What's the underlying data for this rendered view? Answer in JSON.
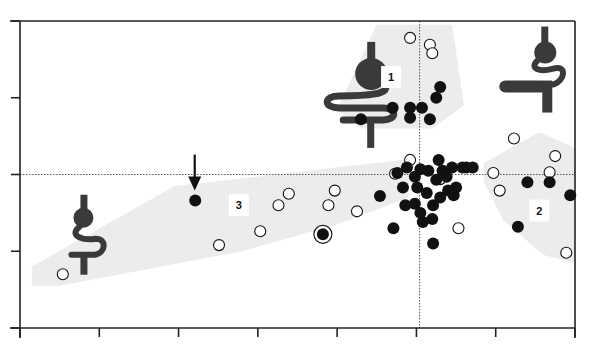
{
  "chart_data": {
    "type": "scatter",
    "title": "",
    "xlabel": "",
    "ylabel": "",
    "xlim": [
      0,
      7
    ],
    "ylim": [
      0,
      4
    ],
    "x_ticks": [
      0,
      1,
      2,
      3,
      4,
      5,
      6,
      7
    ],
    "y_ticks": [
      0,
      1,
      2,
      3,
      4
    ],
    "x_tick_labels": [],
    "y_tick_labels": [],
    "grid": false,
    "reference_lines": {
      "vertical_x": 5.04,
      "horizontal_y": 2.0,
      "style": "dotted"
    },
    "colors": {
      "filled_marker": "#111111",
      "open_marker_fill": "#ffffff",
      "region_fill": "#ececec",
      "axis": "#222222",
      "icon": "#3a3a3a"
    },
    "regions": [
      {
        "label": "1",
        "polygon": [
          [
            4.0,
            2.85
          ],
          [
            4.5,
            3.95
          ],
          [
            5.45,
            3.95
          ],
          [
            5.6,
            2.9
          ],
          [
            5.2,
            2.6
          ],
          [
            4.3,
            2.6
          ]
        ],
        "label_pos": [
          4.68,
          3.27
        ]
      },
      {
        "label": "2",
        "polygon": [
          [
            5.85,
            2.15
          ],
          [
            6.55,
            2.55
          ],
          [
            7.0,
            2.35
          ],
          [
            7.0,
            0.85
          ],
          [
            6.6,
            0.95
          ],
          [
            6.1,
            1.4
          ],
          [
            5.85,
            1.9
          ]
        ],
        "label_pos": [
          6.55,
          1.53
        ]
      },
      {
        "label": "3",
        "polygon": [
          [
            0.15,
            0.55
          ],
          [
            0.15,
            0.8
          ],
          [
            1.95,
            1.85
          ],
          [
            4.9,
            2.2
          ],
          [
            4.9,
            1.7
          ],
          [
            4.0,
            1.35
          ],
          [
            2.8,
            1.0
          ],
          [
            0.5,
            0.55
          ]
        ],
        "label_pos": [
          2.76,
          1.6
        ]
      }
    ],
    "series": [
      {
        "name": "open",
        "marker": "open-circle",
        "points": [
          [
            0.54,
            0.7
          ],
          [
            2.51,
            1.08
          ],
          [
            3.03,
            1.26
          ],
          [
            3.26,
            1.6
          ],
          [
            3.39,
            1.75
          ],
          [
            3.89,
            1.6
          ],
          [
            3.97,
            1.79
          ],
          [
            4.25,
            1.52
          ],
          [
            4.92,
            2.19
          ],
          [
            4.73,
            2.01
          ],
          [
            4.92,
            3.78
          ],
          [
            5.17,
            3.69
          ],
          [
            5.2,
            3.58
          ],
          [
            5.3,
            1.94
          ],
          [
            5.53,
            1.3
          ],
          [
            5.97,
            2.02
          ],
          [
            6.05,
            1.79
          ],
          [
            6.23,
            2.47
          ],
          [
            6.75,
            2.24
          ],
          [
            6.68,
            2.03
          ],
          [
            6.89,
            0.98
          ]
        ]
      },
      {
        "name": "filled",
        "marker": "filled-circle",
        "points": [
          [
            2.21,
            1.66
          ],
          [
            4.3,
            2.72
          ],
          [
            4.7,
            2.87
          ],
          [
            4.92,
            2.87
          ],
          [
            5.07,
            2.87
          ],
          [
            4.92,
            2.74
          ],
          [
            5.17,
            2.72
          ],
          [
            5.3,
            3.14
          ],
          [
            5.25,
            3.0
          ],
          [
            4.54,
            1.72
          ],
          [
            4.71,
            1.3
          ],
          [
            4.76,
            2.02
          ],
          [
            4.88,
            2.09
          ],
          [
            4.98,
            1.97
          ],
          [
            5.05,
            2.07
          ],
          [
            5.15,
            2.05
          ],
          [
            4.83,
            1.83
          ],
          [
            5.01,
            1.83
          ],
          [
            5.13,
            1.76
          ],
          [
            5.25,
            1.93
          ],
          [
            5.38,
            1.97
          ],
          [
            4.86,
            1.6
          ],
          [
            4.98,
            1.62
          ],
          [
            5.05,
            1.5
          ],
          [
            5.21,
            1.6
          ],
          [
            5.3,
            1.7
          ],
          [
            5.4,
            1.79
          ],
          [
            5.5,
            1.83
          ],
          [
            5.63,
            2.09
          ],
          [
            5.47,
            1.73
          ],
          [
            5.08,
            1.38
          ],
          [
            5.2,
            1.42
          ],
          [
            5.21,
            1.1
          ],
          [
            5.28,
            2.19
          ],
          [
            5.33,
            2.05
          ],
          [
            5.45,
            2.09
          ],
          [
            5.58,
            2.09
          ],
          [
            5.71,
            2.09
          ],
          [
            6.4,
            1.9
          ],
          [
            6.68,
            1.9
          ],
          [
            6.94,
            1.73
          ],
          [
            6.28,
            1.32
          ]
        ]
      },
      {
        "name": "highlighted",
        "marker": "filled-circle-ringed",
        "points": [
          [
            3.82,
            1.22
          ]
        ]
      }
    ],
    "annotations": [
      {
        "type": "arrow",
        "target_series": "filled",
        "target_point": [
          2.21,
          1.66
        ],
        "direction": "down"
      },
      {
        "type": "icon",
        "name": "stomach-intestine-large",
        "anchor": [
          3.9,
          3.05
        ]
      },
      {
        "type": "icon",
        "name": "stomach-intestine-bypass",
        "anchor": [
          6.6,
          3.25
        ]
      },
      {
        "type": "icon",
        "name": "stomach-intestine-small",
        "anchor": [
          0.8,
          1.45
        ]
      }
    ]
  }
}
